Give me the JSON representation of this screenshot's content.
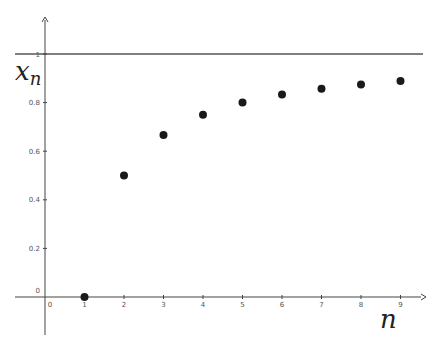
{
  "chart_data": {
    "type": "scatter",
    "title": "",
    "xlabel": "n",
    "ylabel": "x_n",
    "xlabel_main": "n",
    "ylabel_main": "x",
    "ylabel_sub": "n",
    "x": [
      1,
      2,
      3,
      4,
      5,
      6,
      7,
      8,
      9
    ],
    "series": [
      {
        "name": "x_n",
        "values": [
          0,
          0.5,
          0.667,
          0.75,
          0.8,
          0.833,
          0.857,
          0.875,
          0.889
        ]
      }
    ],
    "asymptote": {
      "y": 1,
      "label": "1"
    },
    "xlim": [
      -0.5,
      10
    ],
    "ylim": [
      -0.15,
      1.2
    ],
    "x_ticks": [
      "0",
      "1",
      "2",
      "3",
      "4",
      "5",
      "6",
      "7",
      "8",
      "9"
    ],
    "y_ticks": [
      "0",
      "0.2",
      "0.4",
      "0.6",
      "0.8",
      "1"
    ],
    "grid": false,
    "legend": "none",
    "colors": {
      "points": "#1a1a1a",
      "axis": "#444444",
      "line": "#555555"
    }
  }
}
